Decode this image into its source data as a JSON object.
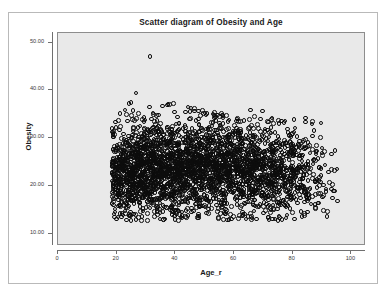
{
  "chart_data": {
    "type": "scatter",
    "title": "Scatter diagram of Obesity and Age",
    "xlabel": "Age_r",
    "ylabel": "Obesity",
    "xlim": [
      0,
      105
    ],
    "ylim": [
      7.5,
      52
    ],
    "grid": false,
    "legend": null,
    "marker": "open-circle",
    "marker_color": "#000000",
    "panel_background": "#e9e9e9",
    "xticks": [
      0,
      20,
      40,
      60,
      80,
      100
    ],
    "xtick_labels": [
      "0",
      "20",
      "40",
      "60",
      "80",
      "100"
    ],
    "yticks": [
      10,
      20,
      30,
      40,
      50
    ],
    "ytick_labels": [
      "10.00",
      "20.00",
      "30.00",
      "40.00",
      "50.00"
    ],
    "n_points": 2600,
    "x_range_observed": [
      18,
      95
    ],
    "y_range_observed": [
      13.0,
      47.3
    ],
    "series": [
      {
        "name": "Obesity vs Age_r",
        "points_summary": [
          {
            "age_bin": "18-25",
            "n": 330,
            "median_obesity": 22.4,
            "p10": 17.6,
            "p90": 29.4,
            "max": 38.0
          },
          {
            "age_bin": "25-30",
            "n": 300,
            "median_obesity": 23.0,
            "p10": 18.0,
            "p90": 30.1,
            "max": 40.3
          },
          {
            "age_bin": "30-35",
            "n": 280,
            "median_obesity": 23.4,
            "p10": 18.2,
            "p90": 30.4,
            "max": 47.3
          },
          {
            "age_bin": "35-40",
            "n": 270,
            "median_obesity": 23.6,
            "p10": 18.4,
            "p90": 30.6,
            "max": 38.0
          },
          {
            "age_bin": "40-45",
            "n": 260,
            "median_obesity": 23.7,
            "p10": 18.5,
            "p90": 30.8,
            "max": 37.4
          },
          {
            "age_bin": "45-50",
            "n": 250,
            "median_obesity": 23.8,
            "p10": 18.6,
            "p90": 30.6,
            "max": 36.5
          },
          {
            "age_bin": "50-55",
            "n": 240,
            "median_obesity": 23.8,
            "p10": 18.5,
            "p90": 30.5,
            "max": 35.8
          },
          {
            "age_bin": "55-60",
            "n": 230,
            "median_obesity": 23.7,
            "p10": 18.3,
            "p90": 30.4,
            "max": 35.5
          },
          {
            "age_bin": "60-65",
            "n": 215,
            "median_obesity": 23.6,
            "p10": 18.0,
            "p90": 30.2,
            "max": 34.9
          },
          {
            "age_bin": "65-70",
            "n": 200,
            "median_obesity": 23.4,
            "p10": 17.8,
            "p90": 30.0,
            "max": 36.9
          },
          {
            "age_bin": "70-75",
            "n": 180,
            "median_obesity": 23.1,
            "p10": 17.4,
            "p90": 29.8,
            "max": 34.5
          },
          {
            "age_bin": "75-80",
            "n": 150,
            "median_obesity": 22.8,
            "p10": 17.0,
            "p90": 29.6,
            "max": 34.2
          },
          {
            "age_bin": "80-85",
            "n": 110,
            "median_obesity": 22.4,
            "p10": 16.5,
            "p90": 29.2,
            "max": 37.9
          },
          {
            "age_bin": "85-90",
            "n": 55,
            "median_obesity": 22.0,
            "p10": 16.0,
            "p90": 28.5,
            "max": 33.8
          },
          {
            "age_bin": "90-95",
            "n": 22,
            "median_obesity": 21.4,
            "p10": 15.6,
            "p90": 27.6,
            "max": 27.8
          }
        ]
      }
    ]
  }
}
